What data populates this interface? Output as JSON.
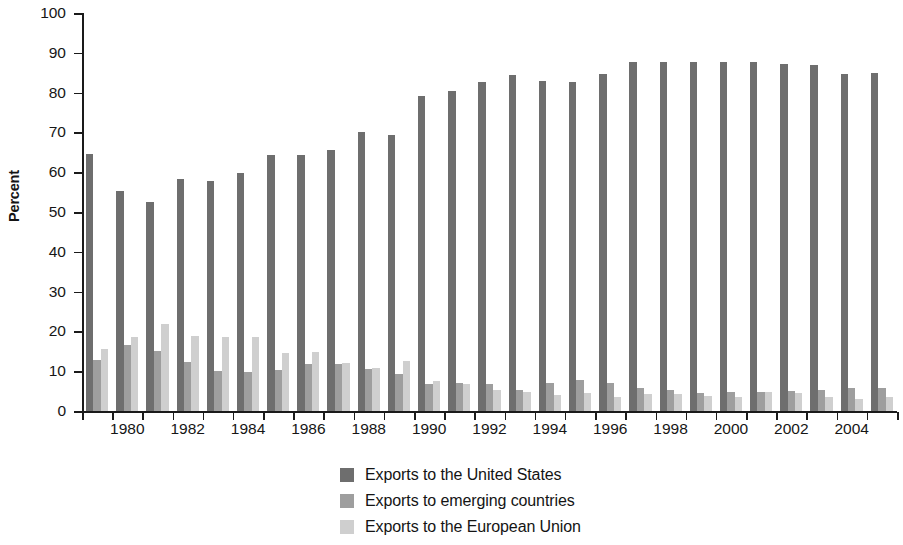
{
  "chart_data": {
    "type": "bar",
    "title": "",
    "subtitle": "",
    "xlabel": "",
    "ylabel": "Percent",
    "ylim": [
      0,
      100
    ],
    "ytick_step": 10,
    "yticks": [
      0,
      10,
      20,
      30,
      40,
      50,
      60,
      70,
      80,
      90,
      100
    ],
    "grid": false,
    "legend_position": "bottom-center",
    "categories": [
      "1979",
      "1980",
      "1981",
      "1982",
      "1983",
      "1984",
      "1985",
      "1986",
      "1987",
      "1988",
      "1989",
      "1990",
      "1991",
      "1992",
      "1993",
      "1994",
      "1995",
      "1996",
      "1997",
      "1998",
      "1999",
      "2000",
      "2001",
      "2002",
      "2003",
      "2004",
      "2005"
    ],
    "xtick_labels": [
      "1980",
      "1982",
      "1984",
      "1986",
      "1988",
      "1990",
      "1992",
      "1994",
      "1996",
      "1998",
      "2000",
      "2002",
      "2004"
    ],
    "series": [
      {
        "name": "Exports to the United States",
        "color": "#6e6e6e",
        "values": [
          64.7,
          55.2,
          52.4,
          58.4,
          57.8,
          59.9,
          64.3,
          64.3,
          65.5,
          70.2,
          69.3,
          79.1,
          80.5,
          82.6,
          84.5,
          82.8,
          82.7,
          84.7,
          87.7,
          87.7,
          87.8,
          87.8,
          87.6,
          87.2,
          87.0,
          84.8,
          85.0
        ]
      },
      {
        "name": "Exports to emerging countries",
        "color": "#9e9e9e",
        "values": [
          12.9,
          16.6,
          15.0,
          12.2,
          10.1,
          9.8,
          10.3,
          11.9,
          11.8,
          10.6,
          9.4,
          6.8,
          7.0,
          6.7,
          5.2,
          7.0,
          7.8,
          7.1,
          5.9,
          5.2,
          4.6,
          4.7,
          4.9,
          5.1,
          5.3,
          5.9,
          5.7
        ]
      },
      {
        "name": "Exports to the European Union",
        "color": "#cfcfcf",
        "values": [
          15.7,
          18.6,
          21.9,
          18.8,
          18.5,
          18.5,
          14.6,
          14.8,
          12.0,
          10.8,
          12.5,
          7.5,
          6.7,
          5.2,
          4.8,
          4.1,
          4.6,
          3.4,
          4.3,
          4.4,
          3.8,
          3.5,
          4.7,
          4.5,
          3.5,
          2.9,
          3.5
        ]
      }
    ]
  },
  "axis": {
    "y_title": "Percent"
  },
  "legend": {
    "items": [
      {
        "label": "Exports to the United States",
        "color": "#6e6e6e"
      },
      {
        "label": "Exports to emerging countries",
        "color": "#9e9e9e"
      },
      {
        "label": "Exports to the European Union",
        "color": "#cfcfcf"
      }
    ]
  }
}
